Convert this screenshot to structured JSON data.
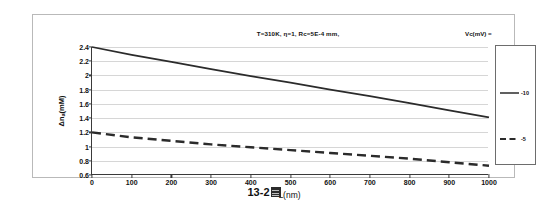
{
  "figure": {
    "caption_number": "13-2",
    "caption_glyph_name": "unrendered-cjk-glyph"
  },
  "chart": {
    "title": "T=310K, η=1, Rc=5E-4 mm,",
    "x_axis_title": "L(nm)",
    "y_axis_title_prefix": "Δn",
    "y_axis_title_sub": "a",
    "y_axis_title_suffix": "(mM)",
    "legend_title": "Vc(mV) ="
  },
  "chart_data": {
    "type": "line",
    "title": "T=310K, η=1, Rc=5E-4 mm,",
    "xlabel": "L(nm)",
    "ylabel": "Δna(mM)",
    "xlim": [
      0,
      1000
    ],
    "ylim": [
      0.6,
      2.4
    ],
    "xticks": [
      0,
      100,
      200,
      300,
      400,
      500,
      600,
      700,
      800,
      900,
      1000
    ],
    "yticks": [
      0.6,
      0.8,
      1.0,
      1.2,
      1.4,
      1.6,
      1.8,
      2.0,
      2.2,
      2.4
    ],
    "ytick_labels": [
      "0.6",
      "0.8",
      "1",
      "1.2",
      "1.4",
      "1.6",
      "1.8",
      "2",
      "2.2",
      "2.4"
    ],
    "xtick_labels": [
      "0",
      "100",
      "200",
      "300",
      "400",
      "500",
      "600",
      "700",
      "800",
      "900",
      "1000"
    ],
    "grid": "horizontal",
    "legend_position": "right",
    "legend_title": "Vc(mV) =",
    "x": [
      0,
      100,
      200,
      300,
      400,
      500,
      600,
      700,
      800,
      900,
      1000
    ],
    "series": [
      {
        "name": "-10",
        "style": "solid",
        "color": "#2b2b2b",
        "values": [
          2.4,
          2.29,
          2.19,
          2.09,
          1.99,
          1.9,
          1.8,
          1.71,
          1.61,
          1.51,
          1.41
        ]
      },
      {
        "name": "-5",
        "style": "dashed",
        "color": "#2b2b2b",
        "values": [
          1.2,
          1.13,
          1.08,
          1.03,
          0.99,
          0.95,
          0.91,
          0.87,
          0.83,
          0.78,
          0.73
        ]
      }
    ]
  }
}
